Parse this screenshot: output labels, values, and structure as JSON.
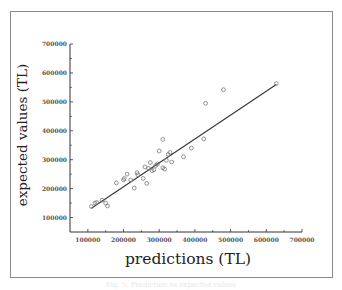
{
  "chart_data": {
    "type": "scatter",
    "title": "",
    "xlabel": "predictions (TL)",
    "ylabel": "expected values (TL)",
    "xlim": [
      50000,
      700000
    ],
    "ylim": [
      50000,
      700000
    ],
    "x_ticks": [
      "100000",
      "200000",
      "300000",
      "400000",
      "500000",
      "600000",
      "700000"
    ],
    "y_ticks": [
      "100000",
      "200000",
      "300000",
      "400000",
      "500000",
      "600000",
      "700000"
    ],
    "grid": false,
    "legend": null,
    "series": [
      {
        "name": "data points",
        "marker": "open-circle",
        "points": [
          [
            110000,
            138000
          ],
          [
            120000,
            150000
          ],
          [
            125000,
            152000
          ],
          [
            140000,
            160000
          ],
          [
            150000,
            150000
          ],
          [
            155000,
            140000
          ],
          [
            180000,
            220000
          ],
          [
            200000,
            230000
          ],
          [
            202000,
            235000
          ],
          [
            210000,
            250000
          ],
          [
            220000,
            230000
          ],
          [
            230000,
            202000
          ],
          [
            238000,
            255000
          ],
          [
            240000,
            248000
          ],
          [
            255000,
            235000
          ],
          [
            260000,
            275000
          ],
          [
            265000,
            218000
          ],
          [
            270000,
            270000
          ],
          [
            275000,
            290000
          ],
          [
            280000,
            262000
          ],
          [
            285000,
            265000
          ],
          [
            290000,
            280000
          ],
          [
            295000,
            285000
          ],
          [
            300000,
            330000
          ],
          [
            310000,
            370000
          ],
          [
            310000,
            272000
          ],
          [
            315000,
            268000
          ],
          [
            320000,
            298000
          ],
          [
            325000,
            318000
          ],
          [
            330000,
            325000
          ],
          [
            335000,
            292000
          ],
          [
            368000,
            310000
          ],
          [
            390000,
            340000
          ],
          [
            425000,
            372000
          ],
          [
            430000,
            495000
          ],
          [
            480000,
            542000
          ],
          [
            628000,
            563000
          ]
        ]
      },
      {
        "name": "fit line",
        "type": "line",
        "points": [
          [
            110000,
            132000
          ],
          [
            628000,
            560000
          ]
        ]
      }
    ]
  },
  "caption": "Fig. 5. Prediction vs expected values"
}
